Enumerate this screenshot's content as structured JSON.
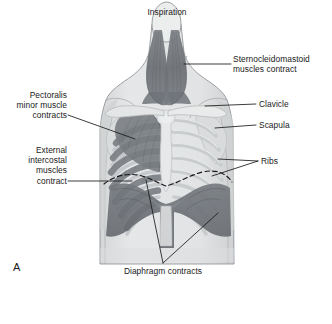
{
  "figure": {
    "title": "Inspiration",
    "panel_letter": "A",
    "type": "anatomical-diagram",
    "style": "grayscale medical illustration"
  },
  "labels": {
    "inspiration": "Inspiration",
    "sternocleidomastoid": "Sternocleidomastoid\nmuscles contract",
    "clavicle": "Clavicle",
    "scapula": "Scapula",
    "ribs": "Ribs",
    "pectoralis_minor": "Pectoralis\nminor muscle\ncontracts",
    "external_intercostal": "External\nintercostal\nmuscles\ncontract",
    "diaphragm": "Diaphragm contracts"
  },
  "colors": {
    "muscle_dark": "#6e7277",
    "muscle_mid": "#8b8f94",
    "bone_light": "#d8dadc",
    "bone_shade": "#c3c6c9",
    "skin_body": "#e4e5e6",
    "skin_shade": "#d2d4d5",
    "outline": "#8a8d90",
    "leader_line": "#1a1a1a",
    "text": "#1a1a1a",
    "background": "#ffffff"
  },
  "structures": [
    {
      "name": "sternocleidomastoid-muscle",
      "state": "contracting",
      "shade": "dark"
    },
    {
      "name": "clavicle",
      "state": "bone",
      "shade": "light"
    },
    {
      "name": "scapula",
      "state": "bone",
      "shade": "light"
    },
    {
      "name": "ribs",
      "state": "bone",
      "shade": "light"
    },
    {
      "name": "sternum",
      "state": "bone",
      "shade": "light"
    },
    {
      "name": "pectoralis-minor-muscle",
      "state": "contracting",
      "shade": "dark"
    },
    {
      "name": "external-intercostal-muscles",
      "state": "contracting",
      "shade": "dark"
    },
    {
      "name": "diaphragm",
      "state": "contracting",
      "shade": "dark"
    },
    {
      "name": "diaphragm-resting-position",
      "state": "dashed-outline",
      "shade": "none"
    }
  ]
}
